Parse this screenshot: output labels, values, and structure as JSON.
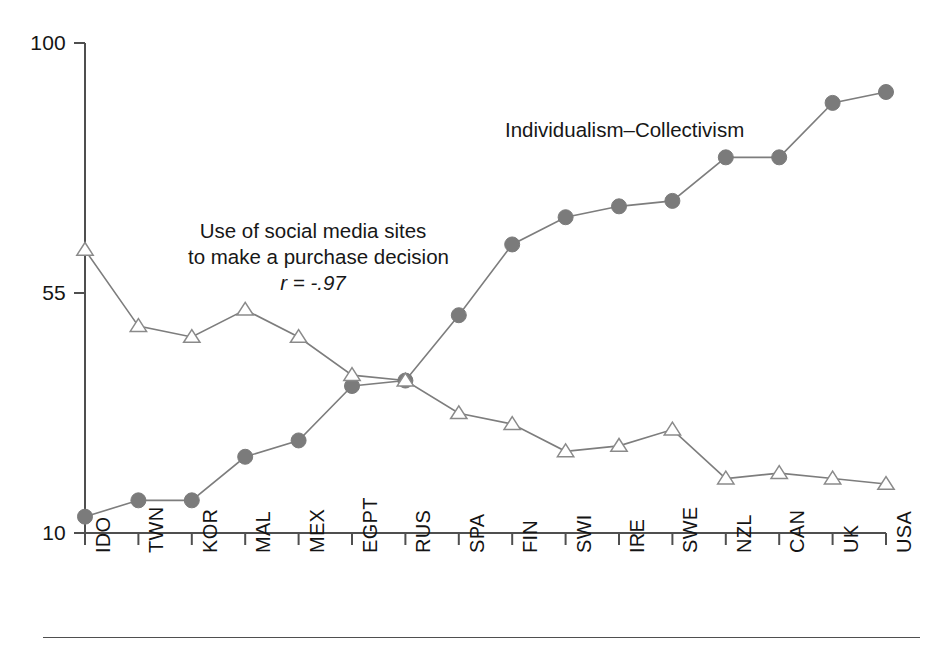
{
  "chart_data": {
    "type": "line",
    "title": "",
    "subtitle": "",
    "xlabel": "",
    "ylabel": "",
    "ylim": [
      10,
      100
    ],
    "yticks": [
      10,
      55,
      100
    ],
    "grid": false,
    "legend_position": "inline-annotations",
    "categories": [
      "IDO",
      "TWN",
      "KOR",
      "MAL",
      "MEX",
      "EGPT",
      "RUS",
      "SPA",
      "FIN",
      "SWI",
      "IRE",
      "SWE",
      "NZL",
      "CAN",
      "UK",
      "USA"
    ],
    "series": [
      {
        "name": "Individualism–Collectivism",
        "marker": "filled-circle",
        "color": "#7b7b7b",
        "values": [
          13,
          16,
          16,
          24,
          27,
          37,
          38,
          50,
          63,
          68,
          70,
          71,
          79,
          79,
          89,
          91
        ]
      },
      {
        "name": "Use of social media sites to make a purchase decision",
        "marker": "open-triangle",
        "color": "#8a8a8a",
        "values": [
          62,
          48,
          46,
          51,
          46,
          39,
          38,
          32,
          30,
          25,
          26,
          29,
          20,
          21,
          20,
          19
        ]
      }
    ],
    "annotations": [
      {
        "id": "individualism-label",
        "text": "Individualism–Collectivism",
        "series": "Individualism–Collectivism"
      },
      {
        "id": "social-media-label",
        "line1": "Use of social media sites",
        "line2": "to make a purchase decision",
        "stat": "r = -.97",
        "series": "Use of social media sites to make a purchase decision"
      }
    ]
  },
  "axis": {
    "y": {
      "tick_top": "100",
      "tick_mid": "55",
      "tick_bottom": "10"
    },
    "x": {
      "labels": [
        "IDO",
        "TWN",
        "KOR",
        "MAL",
        "MEX",
        "EGPT",
        "RUS",
        "SPA",
        "FIN",
        "SWI",
        "IRE",
        "SWE",
        "NZL",
        "CAN",
        "UK",
        "USA"
      ]
    }
  },
  "annotations": {
    "individualism": "Individualism–Collectivism",
    "social_media_line1": "Use of social media sites",
    "social_media_line2": "to make a purchase decision",
    "correlation": "r = -.97"
  },
  "colors": {
    "axis": "#4f4f4f",
    "circle_marker": "#7b7b7b",
    "triangle_stroke": "#8a8a8a",
    "triangle_fill": "#ffffff",
    "line": "#7d7d7d",
    "text": "#141414",
    "background": "#ffffff"
  }
}
